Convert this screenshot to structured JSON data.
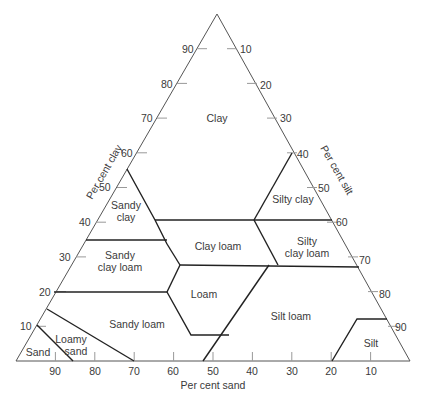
{
  "diagram": {
    "axes": {
      "clay": {
        "label": "Per cent clay",
        "ticks": [
          "10",
          "20",
          "30",
          "40",
          "50",
          "60",
          "70",
          "80",
          "90"
        ]
      },
      "silt": {
        "label": "Per cent silt",
        "ticks": [
          "10",
          "20",
          "30",
          "40",
          "50",
          "60",
          "70",
          "80",
          "90"
        ]
      },
      "sand": {
        "label": "Per cent sand",
        "ticks": [
          "90",
          "80",
          "70",
          "60",
          "50",
          "40",
          "30",
          "20",
          "10"
        ]
      }
    },
    "regions": {
      "clay": "Clay",
      "sandy_clay_1": "Sandy",
      "sandy_clay_2": "clay",
      "silty_clay": "Silty clay",
      "sandy_clay_loam_1": "Sandy",
      "sandy_clay_loam_2": "clay loam",
      "clay_loam": "Clay loam",
      "silty_clay_loam_1": "Silty",
      "silty_clay_loam_2": "clay loam",
      "loam": "Loam",
      "sandy_loam": "Sandy loam",
      "silt_loam": "Silt loam",
      "loamy_sand_1": "Loamy",
      "loamy_sand_2": "sand",
      "sand": "Sand",
      "silt": "Silt"
    },
    "colors": {
      "outline": "#555555",
      "boundary": "#222222",
      "text": "#3a3a3a",
      "background": "#ffffff"
    }
  }
}
